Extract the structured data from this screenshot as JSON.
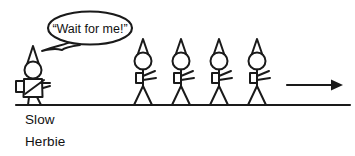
{
  "scene": {
    "title": "Slow Herbie and the marching line",
    "background_color": "#ffffff",
    "ink_color": "#1a1a1a",
    "width": 355,
    "height": 156
  },
  "speech_bubble": {
    "text": "“Wait for me!”",
    "shape": "ellipse",
    "tail_direction": "down-left",
    "center_x": 90,
    "center_y": 28,
    "rx": 42,
    "ry": 16
  },
  "caption": {
    "line1": "Slow",
    "line2": "Herbie",
    "x": 25,
    "line1_y": 124,
    "line2_y": 146
  },
  "ground": {
    "label": "ground-line",
    "x1": 16,
    "x2": 350,
    "y": 105
  },
  "arrow": {
    "label": "direction-of-travel",
    "direction": "right",
    "x1": 287,
    "x2": 338,
    "y": 85
  },
  "herbie": {
    "label": "slow-herbie-figure",
    "x": 33,
    "hat": "pointed-cone-hat",
    "head": "round-head",
    "body": "bulky-box-torso",
    "accessory": "backpack",
    "arms": 1,
    "legs": 2
  },
  "walkers": {
    "label": "marching-stick-figures",
    "count": 4,
    "items": [
      {
        "name": "walker-1",
        "x": 143
      },
      {
        "name": "walker-2",
        "x": 181
      },
      {
        "name": "walker-3",
        "x": 219
      },
      {
        "name": "walker-4",
        "x": 257
      }
    ],
    "hat": "pointed-cone-hat",
    "head": "round-head",
    "accessory": "backpack",
    "arms": 2,
    "legs": 2
  }
}
